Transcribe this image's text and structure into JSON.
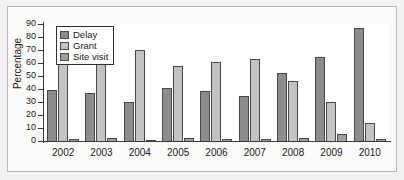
{
  "chart_data": {
    "type": "bar",
    "title": "",
    "xlabel": "",
    "ylabel": "Percentage",
    "ylim": [
      0,
      90
    ],
    "ytick_step": 10,
    "yticks": [
      "90",
      "80",
      "70",
      "60",
      "50",
      "40",
      "30",
      "20",
      "10",
      "0"
    ],
    "grid": false,
    "legend_position": "upper-left-inside",
    "categories": [
      "2002",
      "2003",
      "2004",
      "2005",
      "2006",
      "2007",
      "2008",
      "2009",
      "2010"
    ],
    "series": [
      {
        "name": "Delay",
        "color": "#8c8c8c",
        "values": [
          39.5,
          37,
          30,
          41,
          38.5,
          35,
          52,
          65,
          87
        ]
      },
      {
        "name": "Grant",
        "color": "#c2c2c2",
        "values": [
          60,
          62,
          70,
          58,
          61,
          63,
          46,
          30,
          14
        ]
      },
      {
        "name": "Site visit",
        "color": "#9e9e9e",
        "values": [
          1.5,
          2,
          1,
          2,
          1.5,
          1.5,
          2,
          5.5,
          1.5
        ]
      }
    ]
  },
  "figure": {
    "background": "#f2f2f0",
    "plot_background": "#ffffff",
    "axis_color": "#3a3a3a",
    "border_color": "#b9b9b7"
  }
}
